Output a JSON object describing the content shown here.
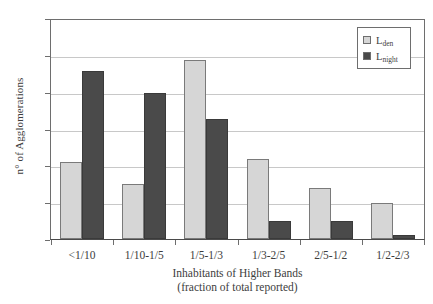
{
  "chart_data": {
    "type": "bar",
    "title": "",
    "subtitle": "",
    "xlabel": "Inhabitants of Higher Bands",
    "xlabel_line2": "(fraction of total reported)",
    "ylabel": "n° of Agglomerations",
    "categories": [
      "<1/10",
      "1/10-1/5",
      "1/5-1/3",
      "1/3-2/5",
      "2/5-1/2",
      "1/2-2/3"
    ],
    "series": [
      {
        "name": "L_den",
        "label_main": "L",
        "label_sub": "den",
        "color": "#d6d6d6",
        "values": [
          21,
          15,
          49,
          22,
          14,
          10
        ]
      },
      {
        "name": "L_night",
        "label_main": "L",
        "label_sub": "night",
        "color": "#4a4a4a",
        "values": [
          46,
          40,
          33,
          5,
          5,
          1
        ]
      }
    ],
    "ylim": [
      0,
      60
    ],
    "ytick_values": [
      0,
      10,
      20,
      30,
      40,
      50,
      60
    ],
    "ytick_labels": [
      "0",
      "10",
      "20",
      "30",
      "40",
      "50",
      "60"
    ],
    "grid": true,
    "grid_axis": "y",
    "legend_position": "top-right",
    "plot_background": "#ffffff",
    "axis_color": "#6e6e6e",
    "grid_color": "#c8c8c8"
  }
}
